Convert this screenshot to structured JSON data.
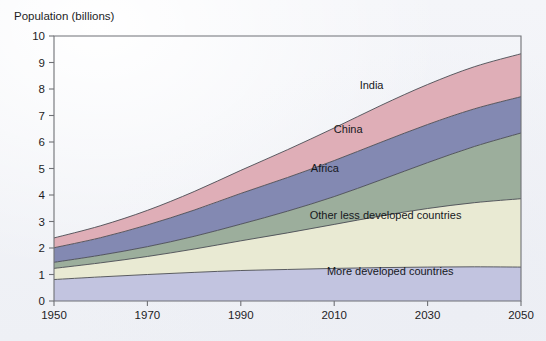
{
  "chart_data": {
    "type": "area",
    "stacked": true,
    "title": "",
    "ylabel": "Population (billions)",
    "xlabel": "",
    "ylim": [
      0,
      10
    ],
    "xlim": [
      1950,
      2050
    ],
    "grid": false,
    "legend_position": "inline-labels",
    "x": [
      1950,
      1960,
      1970,
      1980,
      1990,
      2000,
      2010,
      2020,
      2030,
      2040,
      2050
    ],
    "y_ticks": [
      "0",
      "1",
      "2",
      "3",
      "4",
      "5",
      "6",
      "7",
      "8",
      "9",
      "10"
    ],
    "x_ticks": [
      "1950",
      "1970",
      "1990",
      "2010",
      "2030",
      "2050"
    ],
    "series": [
      {
        "name": "More developed countries",
        "color": "#c2c4e0",
        "values": [
          0.81,
          0.91,
          1.0,
          1.08,
          1.15,
          1.19,
          1.23,
          1.26,
          1.28,
          1.29,
          1.28
        ]
      },
      {
        "name": "Other less developed countries",
        "color": "#e9ead3",
        "values": [
          0.42,
          0.53,
          0.68,
          0.88,
          1.12,
          1.38,
          1.66,
          1.95,
          2.21,
          2.42,
          2.58
        ]
      },
      {
        "name": "Africa",
        "color": "#9cae9c",
        "values": [
          0.23,
          0.29,
          0.37,
          0.48,
          0.63,
          0.82,
          1.05,
          1.36,
          1.73,
          2.12,
          2.48
        ]
      },
      {
        "name": "China",
        "color": "#8389b2",
        "values": [
          0.55,
          0.66,
          0.82,
          0.99,
          1.16,
          1.27,
          1.36,
          1.42,
          1.44,
          1.42,
          1.37
        ]
      },
      {
        "name": "India",
        "color": "#dfaeb7",
        "values": [
          0.37,
          0.45,
          0.55,
          0.7,
          0.87,
          1.05,
          1.23,
          1.39,
          1.51,
          1.59,
          1.62
        ]
      }
    ],
    "series_totals": [
      2.38,
      2.84,
      3.42,
      4.13,
      4.93,
      5.71,
      6.53,
      7.38,
      8.17,
      8.84,
      9.33
    ],
    "band_labels": [
      {
        "name": "India",
        "x": 2018,
        "y": 8.0
      },
      {
        "name": "China",
        "x": 2013,
        "y": 6.35
      },
      {
        "name": "Africa",
        "x": 2008,
        "y": 4.85
      },
      {
        "name": "Other less developed countries",
        "x": 2021,
        "y": 3.1
      },
      {
        "name": "More developed countries",
        "x": 2022,
        "y": 1.0
      }
    ]
  }
}
